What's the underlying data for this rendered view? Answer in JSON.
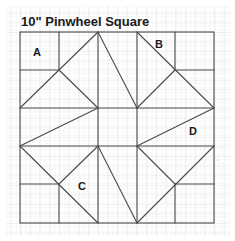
{
  "diagram": {
    "title": "10\" Pinwheel Square",
    "labels": [
      {
        "id": "A",
        "text": "A",
        "x": 37,
        "y": 56
      },
      {
        "id": "B",
        "text": "B",
        "x": 159,
        "y": 48
      },
      {
        "id": "C",
        "text": "C",
        "x": 82,
        "y": 190
      },
      {
        "id": "D",
        "text": "D",
        "x": 193,
        "y": 135
      }
    ],
    "block": {
      "x0": 20,
      "y0": 32,
      "x1": 214,
      "y1": 223,
      "cells": 5
    },
    "colors": {
      "background": "#ffffff",
      "grid_minor": "#e6e6e6",
      "grid_major": "#cfcfcf",
      "outline": "#4a4a4a"
    }
  }
}
